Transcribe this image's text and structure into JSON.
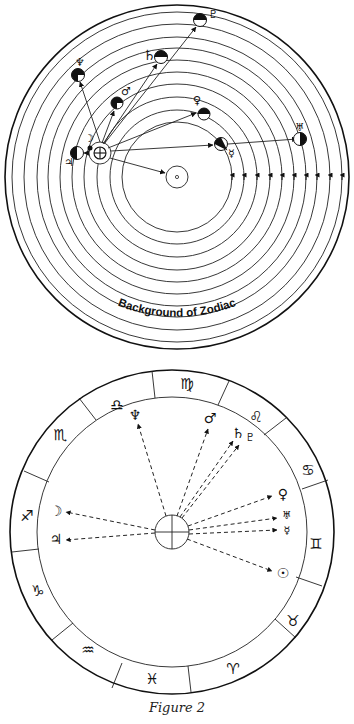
{
  "figure": {
    "caption": "Figure 2",
    "colors": {
      "ink": "#111111",
      "paper": "#ffffff"
    }
  },
  "heliocentric_diagram": {
    "label": "Background of Zodiac",
    "center": {
      "name": "Sun",
      "glyph": "⊙"
    },
    "observer": {
      "name": "Earth",
      "glyph": "⊕"
    },
    "orbit_count": 10,
    "planets": [
      {
        "name": "Moon",
        "glyph": "☽"
      },
      {
        "name": "Jupiter",
        "glyph": "♃"
      },
      {
        "name": "Neptune",
        "glyph": "♆"
      },
      {
        "name": "Mars",
        "glyph": "♂"
      },
      {
        "name": "Saturn",
        "glyph": "♄"
      },
      {
        "name": "Pluto",
        "glyph": "♇"
      },
      {
        "name": "Venus",
        "glyph": "♀"
      },
      {
        "name": "Mercury",
        "glyph": "☿"
      },
      {
        "name": "Uranus",
        "glyph": "♅"
      }
    ]
  },
  "geocentric_wheel": {
    "center": {
      "name": "Earth",
      "glyph": "⊕"
    },
    "zodiac_signs": [
      {
        "name": "Libra",
        "glyph": "♎"
      },
      {
        "name": "Virgo",
        "glyph": "♍"
      },
      {
        "name": "Leo",
        "glyph": "♌"
      },
      {
        "name": "Cancer",
        "glyph": "♋"
      },
      {
        "name": "Gemini",
        "glyph": "♊"
      },
      {
        "name": "Taurus",
        "glyph": "♉"
      },
      {
        "name": "Aries",
        "glyph": "♈"
      },
      {
        "name": "Pisces",
        "glyph": "♓"
      },
      {
        "name": "Aquarius",
        "glyph": "♒"
      },
      {
        "name": "Capricorn",
        "glyph": "♑"
      },
      {
        "name": "Sagittarius",
        "glyph": "♐"
      },
      {
        "name": "Scorpio",
        "glyph": "♏"
      }
    ],
    "planet_labels": [
      {
        "name": "Neptune",
        "glyph": "♆"
      },
      {
        "name": "Mars",
        "glyph": "♂"
      },
      {
        "name": "Saturn",
        "glyph": "♄"
      },
      {
        "name": "Pluto",
        "glyph": "♇"
      },
      {
        "name": "Venus",
        "glyph": "♀"
      },
      {
        "name": "Uranus",
        "glyph": "♅"
      },
      {
        "name": "Mercury",
        "glyph": "☿"
      },
      {
        "name": "Sun",
        "glyph": "☉"
      },
      {
        "name": "Moon",
        "glyph": "☽"
      },
      {
        "name": "Jupiter",
        "glyph": "♃"
      }
    ]
  }
}
